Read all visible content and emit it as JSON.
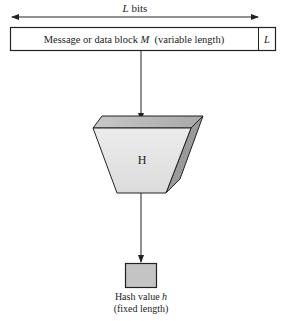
{
  "diagram": {
    "length_arrow": {
      "label_var": "L",
      "label_rest": " bits"
    },
    "message_block": {
      "text_pre": "Message or data block ",
      "text_var": "M",
      "text_post": "  (variable length)",
      "length_field": "L"
    },
    "hash_function": {
      "label": "H"
    },
    "output": {
      "line1_pre": "Hash value ",
      "line1_var": "h",
      "line2": "(fixed length)"
    },
    "colors": {
      "stroke": "#222222",
      "top_face": "#b8b8b8",
      "front_face": "#e6e6e6",
      "side_face": "#9a9a9a",
      "hash_box": "#c4c4c4"
    }
  }
}
